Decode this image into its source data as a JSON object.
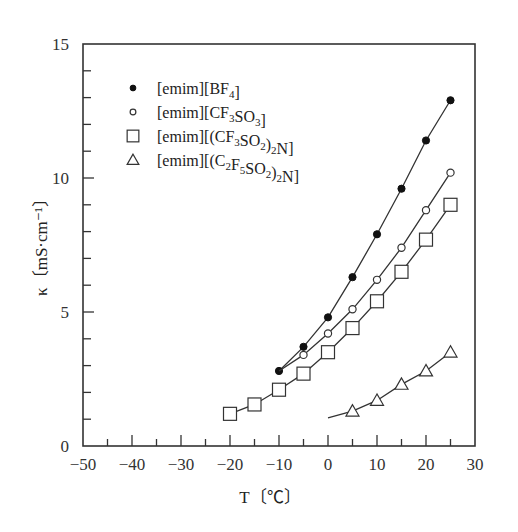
{
  "chart_data": {
    "type": "line",
    "title": "",
    "xlabel": "T〔℃〕",
    "ylabel": "κ〔mS·cm⁻¹〕",
    "xlim": [
      -50,
      30
    ],
    "ylim": [
      0,
      15
    ],
    "xticks": [
      -50,
      -40,
      -30,
      -20,
      -10,
      0,
      10,
      20,
      30
    ],
    "xtick_labels": [
      "−50",
      "−40",
      "−30",
      "−20",
      "−10",
      "0",
      "10",
      "20",
      "30"
    ],
    "xminor_step": 5,
    "yticks": [
      0,
      5,
      10,
      15
    ],
    "ytick_labels": [
      "0",
      "5",
      "10",
      "15"
    ],
    "yminor_step": 1,
    "grid": false,
    "legend_position": "upper-left",
    "series": [
      {
        "name": "[emim][BF4]",
        "legend_parts": [
          [
            "[emim][BF",
            ""
          ],
          [
            "4",
            "sub"
          ],
          [
            "]",
            ""
          ]
        ],
        "marker": "filled-circle",
        "x": [
          -10,
          -5,
          0,
          5,
          10,
          15,
          20,
          25
        ],
        "values": [
          2.8,
          3.7,
          4.8,
          6.3,
          7.9,
          9.6,
          11.4,
          12.9
        ],
        "line_x": [
          -10,
          -5,
          0,
          5,
          10,
          15,
          20,
          25
        ],
        "line_y": [
          2.8,
          3.7,
          4.8,
          6.3,
          7.9,
          9.6,
          11.4,
          12.9
        ]
      },
      {
        "name": "[emim][CF3SO3]",
        "legend_parts": [
          [
            "[emim][CF",
            ""
          ],
          [
            "3",
            "sub"
          ],
          [
            "SO",
            ""
          ],
          [
            "3",
            "sub"
          ],
          [
            "]",
            ""
          ]
        ],
        "marker": "open-circle",
        "x": [
          -5,
          0,
          5,
          10,
          15,
          20,
          25
        ],
        "values": [
          3.4,
          4.2,
          5.1,
          6.2,
          7.4,
          8.8,
          10.2
        ],
        "line_x": [
          -10,
          -5,
          0,
          5,
          10,
          15,
          20,
          25
        ],
        "line_y": [
          2.8,
          3.4,
          4.2,
          5.1,
          6.2,
          7.4,
          8.8,
          10.2
        ]
      },
      {
        "name": "[emim][(CF3SO2)2N]",
        "legend_parts": [
          [
            "[emim][(CF",
            ""
          ],
          [
            "3",
            "sub"
          ],
          [
            "SO",
            ""
          ],
          [
            "2",
            "sub"
          ],
          [
            ")",
            ""
          ],
          [
            "2",
            "sub"
          ],
          [
            "N]",
            ""
          ]
        ],
        "marker": "open-square",
        "x": [
          -20,
          -15,
          -10,
          -5,
          0,
          5,
          10,
          15,
          20,
          25
        ],
        "values": [
          1.2,
          1.55,
          2.1,
          2.7,
          3.5,
          4.4,
          5.4,
          6.5,
          7.7,
          9.0
        ],
        "line_x": [
          -20,
          -15,
          -10,
          -5,
          0,
          5,
          10,
          15,
          20,
          25
        ],
        "line_y": [
          1.2,
          1.55,
          2.1,
          2.7,
          3.5,
          4.4,
          5.4,
          6.5,
          7.7,
          9.0
        ]
      },
      {
        "name": "[emim][(C2F5SO2)2N]",
        "legend_parts": [
          [
            "[emim][(C",
            ""
          ],
          [
            "2",
            "sub"
          ],
          [
            "F",
            ""
          ],
          [
            "5",
            "sub"
          ],
          [
            "SO",
            ""
          ],
          [
            "2",
            "sub"
          ],
          [
            ")",
            ""
          ],
          [
            "2",
            "sub"
          ],
          [
            "N]",
            ""
          ]
        ],
        "marker": "open-triangle",
        "x": [
          5,
          10,
          15,
          20,
          25
        ],
        "values": [
          1.3,
          1.7,
          2.3,
          2.8,
          3.5
        ],
        "line_x": [
          0,
          5,
          10,
          15,
          20,
          25
        ],
        "line_y": [
          1.05,
          1.3,
          1.7,
          2.3,
          2.8,
          3.5
        ]
      }
    ]
  },
  "layout": {
    "plot_left": 83,
    "plot_right": 475,
    "plot_top": 44,
    "plot_bottom": 446
  }
}
